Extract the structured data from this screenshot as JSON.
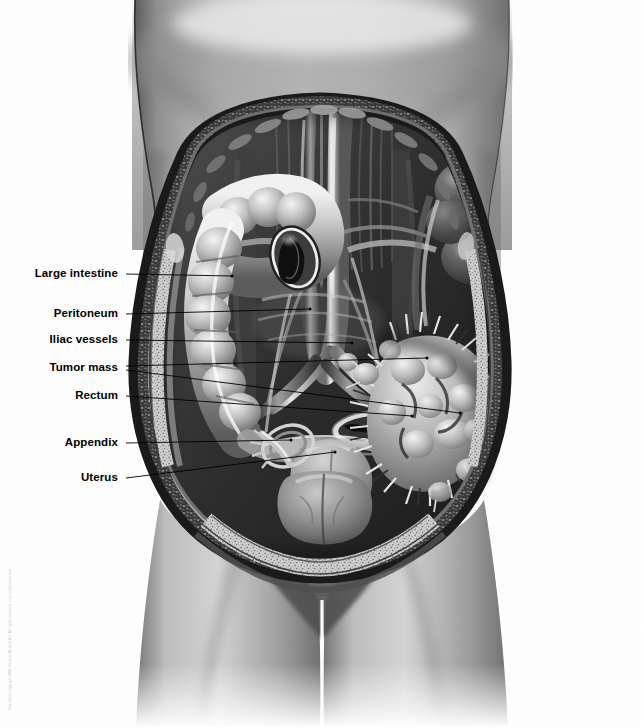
{
  "illustration": {
    "title": "Female abdominopelvic cavity with metastatic tumor mass",
    "subject": "anterior cutaway view of female torso",
    "style": "grayscale medical airbrush illustration",
    "background_color": "#ffffff",
    "credit_line": "Illustration copyright 2001 Nucleus Medical Art. All rights reserved. www.nucleusinc.com"
  },
  "labels": [
    {
      "id": "large-intestine",
      "text": "Large intestine",
      "text_x": 118,
      "text_y": 274,
      "leaders": [
        {
          "x1": 126,
          "y1": 274,
          "x2": 232,
          "y2": 276
        }
      ]
    },
    {
      "id": "peritoneum",
      "text": "Peritoneum",
      "text_x": 118,
      "text_y": 314,
      "leaders": [
        {
          "x1": 126,
          "y1": 314,
          "x2": 310,
          "y2": 309
        }
      ]
    },
    {
      "id": "iliac-vessels",
      "text": "Iliac vessels",
      "text_x": 118,
      "text_y": 340,
      "leaders": [
        {
          "x1": 126,
          "y1": 340,
          "x2": 352,
          "y2": 343
        }
      ]
    },
    {
      "id": "tumor-mass",
      "text": "Tumor mass",
      "text_x": 118,
      "text_y": 368,
      "leaders": [
        {
          "x1": 126,
          "y1": 366,
          "x2": 427,
          "y2": 358
        },
        {
          "x1": 126,
          "y1": 370,
          "x2": 460,
          "y2": 413
        }
      ]
    },
    {
      "id": "rectum",
      "text": "Rectum",
      "text_x": 118,
      "text_y": 396,
      "leaders": [
        {
          "x1": 126,
          "y1": 396,
          "x2": 412,
          "y2": 416
        }
      ]
    },
    {
      "id": "appendix",
      "text": "Appendix",
      "text_x": 118,
      "text_y": 443,
      "leaders": [
        {
          "x1": 126,
          "y1": 443,
          "x2": 291,
          "y2": 440
        }
      ]
    },
    {
      "id": "uterus",
      "text": "Uterus",
      "text_x": 118,
      "text_y": 478,
      "leaders": [
        {
          "x1": 126,
          "y1": 478,
          "x2": 335,
          "y2": 452
        }
      ]
    }
  ],
  "anatomy": {
    "structures": [
      "skin of torso",
      "abdominal wall cut edge",
      "subcutaneous fat layer",
      "peritoneum",
      "ascending colon",
      "transverse colon cut cross-section",
      "descending colon",
      "abdominal aorta",
      "inferior vena cava",
      "common iliac arteries",
      "common iliac veins",
      "small bowel loops",
      "psoas muscle",
      "uterus",
      "fallopian tubes",
      "ovaries",
      "urinary bladder",
      "rectum cross-section",
      "vermiform appendix",
      "metastatic tumor mass",
      "thighs"
    ]
  }
}
